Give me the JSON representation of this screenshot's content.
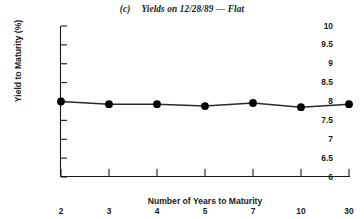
{
  "chart_data": {
    "type": "line",
    "title_parts": {
      "panel_tag": "(c)",
      "text": "Yields on 12/28/89 — Flat"
    },
    "xlabel": "Number of Years to Maturity",
    "ylabel": "Yield to Maturity (%)",
    "x_is_categorical": true,
    "categories": [
      "2",
      "3",
      "4",
      "5",
      "7",
      "10",
      "30"
    ],
    "xtick_labels": [
      "2",
      "3",
      "4",
      "5",
      "7",
      "10",
      "30"
    ],
    "values": [
      8.0,
      7.93,
      7.93,
      7.88,
      7.96,
      7.85,
      7.93
    ],
    "ylim": [
      6,
      10
    ],
    "ytick_labels": [
      "10",
      "9.5",
      "9",
      "8.5",
      "8",
      "7.5",
      "7",
      "6.5",
      "6"
    ],
    "yticks": [
      10,
      9.5,
      9,
      8.5,
      8,
      7.5,
      7,
      6.5,
      6
    ],
    "grid": false,
    "legend": null,
    "series": [
      {
        "name": "Yield to Maturity",
        "values": [
          8.0,
          7.93,
          7.93,
          7.88,
          7.96,
          7.85,
          7.93
        ],
        "marker": "filled-circle",
        "marker_color": "#000000",
        "line_color": "#2b2b2b"
      }
    ],
    "colors": {
      "line": "#2b2b2b",
      "marker": "#000000",
      "axis": "#1a1a1a",
      "text": "#1a1a1a",
      "background": "#ffffff"
    }
  }
}
